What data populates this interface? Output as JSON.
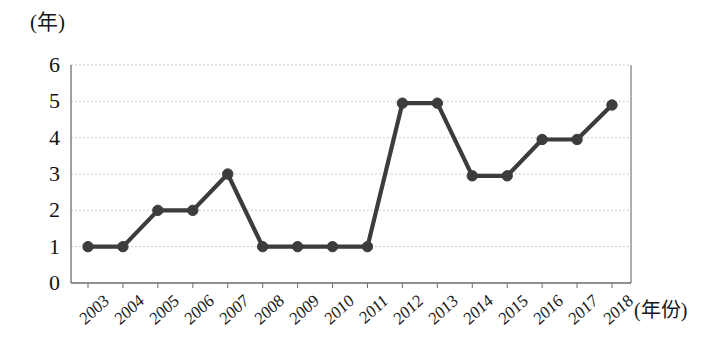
{
  "axes": {
    "y_unit_label": "(年)",
    "x_unit_label": "(年份)"
  },
  "chart_data": {
    "type": "line",
    "title": "",
    "subtitle": "",
    "xlabel": "(年份)",
    "ylabel": "(年)",
    "categories": [
      "2003",
      "2004",
      "2005",
      "2006",
      "2007",
      "2008",
      "2009",
      "2010",
      "2011",
      "2012",
      "2013",
      "2014",
      "2015",
      "2016",
      "2017",
      "2018"
    ],
    "values": [
      1,
      1,
      2,
      2,
      3,
      1,
      1,
      1,
      1,
      4.95,
      4.95,
      2.95,
      2.95,
      3.95,
      3.95,
      4.9
    ],
    "series": [
      {
        "name": "",
        "values": [
          1,
          1,
          2,
          2,
          3,
          1,
          1,
          1,
          1,
          4.95,
          4.95,
          2.95,
          2.95,
          3.95,
          3.95,
          4.9
        ]
      }
    ],
    "ylim": [
      0,
      6
    ],
    "y_ticks": [
      0,
      1,
      2,
      3,
      4,
      5,
      6
    ],
    "y_tick_labels": [
      "0",
      "1",
      "2",
      "3",
      "4",
      "5",
      "6"
    ],
    "x_tick_labels": [
      "2003",
      "2004",
      "2005",
      "2006",
      "2007",
      "2008",
      "2009",
      "2010",
      "2011",
      "2012",
      "2013",
      "2014",
      "2015",
      "2016",
      "2017",
      "2018"
    ],
    "grid": true,
    "grid_style": "dotted",
    "grid_color": "#b9bfcc",
    "legend": false,
    "legend_position": "none",
    "line_color": "#3c3c3c",
    "marker": "circle",
    "marker_color": "#3c3c3c",
    "axis_color": "#6d6d6d",
    "background_color": "#ffffff",
    "annotations": []
  }
}
